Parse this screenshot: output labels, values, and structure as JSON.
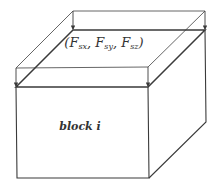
{
  "diagram": {
    "type": "3d-block-with-surface-force",
    "colors": {
      "background": "#ffffff",
      "stroke": "#3a3a3a",
      "thin_stroke": "#555555",
      "text": "#333333"
    },
    "labels": {
      "force_open": "(",
      "force_close": ")",
      "force_components": [
        {
          "base": "F",
          "sub": "sx"
        },
        {
          "base": "F",
          "sub": "sy"
        },
        {
          "base": "F",
          "sub": "sz"
        }
      ],
      "separator": ", ",
      "block": "block i"
    },
    "geometry": {
      "outer_top_face": [
        [
          73,
          11
        ],
        [
          205,
          11
        ],
        [
          148,
          67
        ],
        [
          16,
          68
        ]
      ],
      "inner_top_face": [
        [
          73,
          30
        ],
        [
          205,
          30
        ],
        [
          148,
          87
        ],
        [
          16,
          87
        ]
      ],
      "front_face": [
        [
          16,
          87
        ],
        [
          148,
          87
        ],
        [
          149,
          178
        ],
        [
          17,
          178
        ]
      ],
      "right_face": [
        [
          148,
          87
        ],
        [
          205,
          30
        ],
        [
          206,
          122
        ],
        [
          149,
          178
        ]
      ],
      "arrows": [
        {
          "from": [
            73,
            11
          ],
          "to": [
            73,
            30
          ]
        },
        {
          "from": [
            205,
            11
          ],
          "to": [
            205,
            30
          ]
        },
        {
          "from": [
            148,
            67
          ],
          "to": [
            148,
            87
          ]
        },
        {
          "from": [
            16,
            68
          ],
          "to": [
            16,
            87
          ]
        }
      ]
    }
  }
}
